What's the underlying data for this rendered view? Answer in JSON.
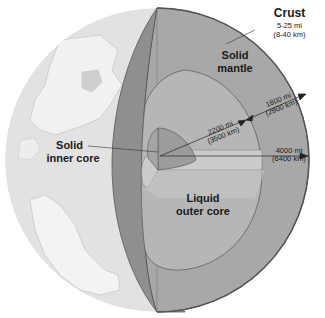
{
  "diagram": {
    "colors": {
      "surface_ocean": "#e3e3e3",
      "surface_land": "#f2f2f2",
      "crust_cut": "#8a8a8a",
      "mantle": "#a9a9a9",
      "mantle_side": "#9d9d9d",
      "outer_core": "#b8b8b8",
      "outer_core_top": "#c9c9c9",
      "inner_core": "#9f9f9f",
      "outline": "#555555"
    },
    "labels": {
      "crust": {
        "name": "Crust",
        "mi": "5-25 mi",
        "km": "(8-40 km)"
      },
      "mantle": {
        "line1": "Solid",
        "line2": "mantle"
      },
      "inner_core": {
        "line1": "Solid",
        "line2": "inner core"
      },
      "outer_core": {
        "line1": "Liquid",
        "line2": "outer core"
      },
      "mantle_thickness": {
        "mi": "1800 mi",
        "km": "(2900 km)"
      },
      "core_radius": {
        "mi": "2200 mi",
        "km": "(3500 km)"
      },
      "earth_radius": {
        "mi": "4000 mi",
        "km": "(6400 km)"
      }
    }
  }
}
